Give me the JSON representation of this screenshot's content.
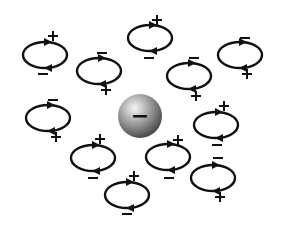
{
  "diagram": {
    "title": "",
    "central_ion": {
      "label": "−",
      "charge": "negative",
      "cx": 140,
      "cy": 116,
      "r": 22,
      "colors": {
        "highlight": "#f4f4f4",
        "mid": "#9a9a9a",
        "dark": "#3a3a3a"
      }
    },
    "dipoles": [
      {
        "id": "d1",
        "cx": 45,
        "cy": 55,
        "rx": 22,
        "ry": 13,
        "plus": [
          53,
          36
        ],
        "minus": [
          43,
          74
        ]
      },
      {
        "id": "d2",
        "cx": 99,
        "cy": 71,
        "rx": 22,
        "ry": 13,
        "plus": [
          106,
          90
        ],
        "minus": [
          102,
          53
        ]
      },
      {
        "id": "d3",
        "cx": 150,
        "cy": 38,
        "rx": 22,
        "ry": 13,
        "plus": [
          157,
          20
        ],
        "minus": [
          149,
          58
        ]
      },
      {
        "id": "d4",
        "cx": 189,
        "cy": 76,
        "rx": 22,
        "ry": 13,
        "plus": [
          196,
          96
        ],
        "minus": [
          194,
          58
        ]
      },
      {
        "id": "d5",
        "cx": 240,
        "cy": 55,
        "rx": 22,
        "ry": 13,
        "plus": [
          247,
          74
        ],
        "minus": [
          245,
          38
        ]
      },
      {
        "id": "d6",
        "cx": 48,
        "cy": 118,
        "rx": 22,
        "ry": 13,
        "plus": [
          56,
          137
        ],
        "minus": [
          53,
          100
        ]
      },
      {
        "id": "d7",
        "cx": 93,
        "cy": 158,
        "rx": 22,
        "ry": 13,
        "plus": [
          100,
          139
        ],
        "minus": [
          93,
          178
        ]
      },
      {
        "id": "d8",
        "cx": 127,
        "cy": 195,
        "rx": 22,
        "ry": 13,
        "plus": [
          134,
          176
        ],
        "minus": [
          127,
          214
        ]
      },
      {
        "id": "d9",
        "cx": 168,
        "cy": 157,
        "rx": 22,
        "ry": 13,
        "plus": [
          178,
          140
        ],
        "minus": [
          169,
          178
        ]
      },
      {
        "id": "d10",
        "cx": 216,
        "cy": 125,
        "rx": 22,
        "ry": 13,
        "plus": [
          224,
          106
        ],
        "minus": [
          217,
          145
        ]
      },
      {
        "id": "d11",
        "cx": 213,
        "cy": 178,
        "rx": 22,
        "ry": 13,
        "plus": [
          220,
          197
        ],
        "minus": [
          218,
          158
        ]
      }
    ],
    "colors": {
      "stroke": "#111111",
      "background": "#ffffff"
    }
  }
}
